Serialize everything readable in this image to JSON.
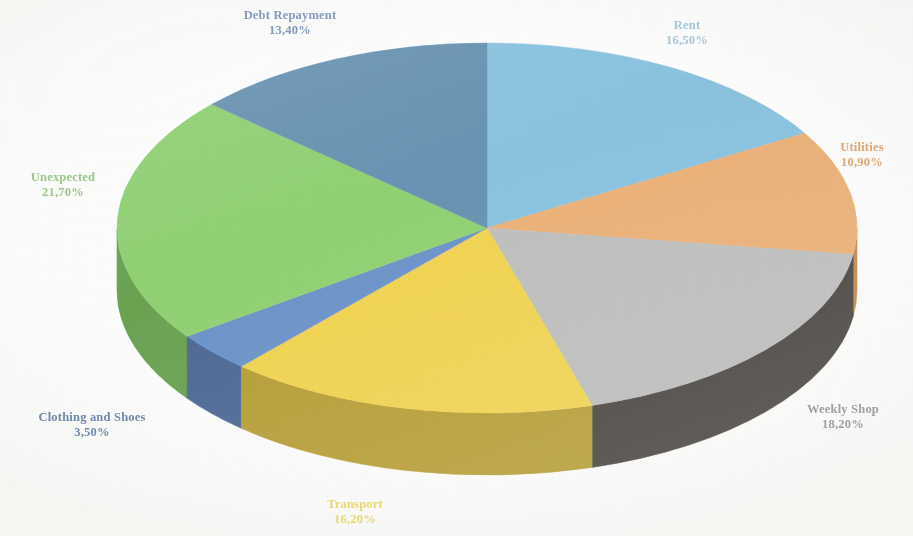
{
  "chart_data": {
    "type": "pie",
    "title": "",
    "subtitle": "",
    "xlabel": "",
    "ylabel": "",
    "legend_position": "none",
    "grid": false,
    "three_d": true,
    "value_suffix": "%",
    "decimal_separator": ",",
    "categories": [
      "Rent",
      "Utilities",
      "Weekly Shop",
      "Transport",
      "Clothing and Shoes",
      "Unexpected",
      "Debt Repayment"
    ],
    "values": [
      16.5,
      10.9,
      18.2,
      16.2,
      3.5,
      21.7,
      13.4
    ],
    "value_labels": [
      "16,50%",
      "10,90%",
      "18,20%",
      "16,20%",
      "3,50%",
      "21,70%",
      "13,40%"
    ],
    "colors": [
      "#7FC4E8",
      "#F5AE68",
      "#BDBDBD",
      "#FAD637",
      "#5E8FD0",
      "#86D563",
      "#5B8FB5"
    ],
    "side_colors": [
      "#4E8FB5",
      "#C8813C",
      "#3A352F",
      "#B99A1C",
      "#3D5E93",
      "#5DA13F",
      "#3E6A8C"
    ],
    "slices": [
      {
        "name": "Rent",
        "value": 16.5,
        "label": "Rent",
        "value_label": "16,50%",
        "color": "#7FC4E8",
        "side_color": "#4E8FB5",
        "label_color": "#9CC9E4"
      },
      {
        "name": "Utilities",
        "value": 10.9,
        "label": "Utilities",
        "value_label": "10,90%",
        "color": "#F5AE68",
        "side_color": "#C8813C",
        "label_color": "#E8A25C"
      },
      {
        "name": "Weekly Shop",
        "value": 18.2,
        "label": "Weekly Shop",
        "value_label": "18,20%",
        "color": "#BDBDBD",
        "side_color": "#3A352F",
        "label_color": "#8C8C8C"
      },
      {
        "name": "Transport",
        "value": 16.2,
        "label": "Transport",
        "value_label": "16,20%",
        "color": "#FAD637",
        "side_color": "#B99A1C",
        "label_color": "#F2DA4A"
      },
      {
        "name": "Clothing and Shoes",
        "value": 3.5,
        "label": "Clothing and Shoes",
        "value_label": "3,50%",
        "color": "#5E8FD0",
        "side_color": "#3D5E93",
        "label_color": "#5E7FA8"
      },
      {
        "name": "Unexpected",
        "value": 21.7,
        "label": "Unexpected",
        "value_label": "21,70%",
        "color": "#86D563",
        "side_color": "#5DA13F",
        "label_color": "#8FC97A"
      },
      {
        "name": "Debt Repayment",
        "value": 13.4,
        "label": "Debt Repayment",
        "value_label": "13,40%",
        "color": "#5B8FB5",
        "side_color": "#3E6A8C",
        "label_color": "#6E8FB8"
      }
    ]
  },
  "labels": {
    "debt_repayment": {
      "name": "Debt Repayment",
      "value": "13,40%"
    },
    "rent": {
      "name": "Rent",
      "value": "16,50%"
    },
    "utilities": {
      "name": "Utilities",
      "value": "10,90%"
    },
    "weekly_shop": {
      "name": "Weekly Shop",
      "value": "18,20%"
    },
    "transport": {
      "name": "Transport",
      "value": "16,20%"
    },
    "clothing_and_shoes": {
      "name": "Clothing and Shoes",
      "value": "3,50%"
    },
    "unexpected": {
      "name": "Unexpected",
      "value": "21,70%"
    }
  },
  "theme": {
    "background": "#ffffff",
    "label_font_weight": "bold"
  }
}
